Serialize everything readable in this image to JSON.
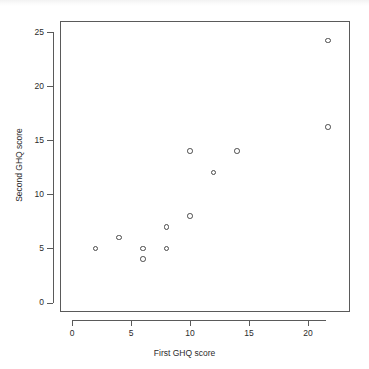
{
  "chart_data": {
    "type": "scatter",
    "title": "",
    "xlabel": "First GHQ score",
    "ylabel": "Second GHQ score",
    "xlim": [
      -1,
      23
    ],
    "ylim": [
      -1.2,
      26.5
    ],
    "xticks": [
      0,
      5,
      10,
      15,
      20
    ],
    "yticks": [
      0,
      5,
      10,
      15,
      20,
      25
    ],
    "xtick_labels": [
      "0",
      "5",
      "10",
      "15",
      "20"
    ],
    "ytick_labels": [
      "0",
      "5",
      "10",
      "15",
      "20",
      "25"
    ],
    "grid": false,
    "legend": null,
    "marker": "open-circle",
    "marker_color": "#4a4a4a",
    "points": [
      {
        "x": 2,
        "y": 5
      },
      {
        "x": 4,
        "y": 6
      },
      {
        "x": 6,
        "y": 5
      },
      {
        "x": 6,
        "y": 4
      },
      {
        "x": 8,
        "y": 5
      },
      {
        "x": 8,
        "y": 7
      },
      {
        "x": 10,
        "y": 8
      },
      {
        "x": 10,
        "y": 14
      },
      {
        "x": 12,
        "y": 12
      },
      {
        "x": 14,
        "y": 14
      },
      {
        "x": 21.7,
        "y": 16.2
      },
      {
        "x": 21.7,
        "y": 24.2
      }
    ]
  }
}
